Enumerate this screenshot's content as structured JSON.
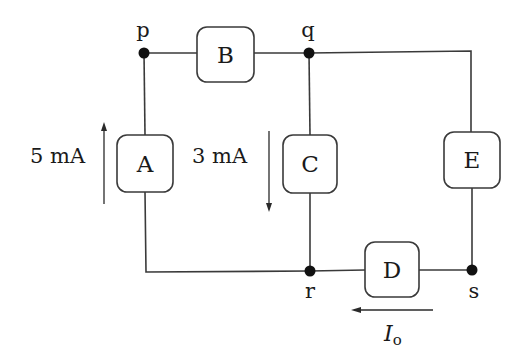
{
  "diagram": {
    "type": "circuit",
    "nodes": [
      {
        "id": "p",
        "label": "p",
        "x": 144,
        "y": 53
      },
      {
        "id": "q",
        "label": "q",
        "x": 309,
        "y": 53
      },
      {
        "id": "r",
        "label": "r",
        "x": 310,
        "y": 271
      },
      {
        "id": "s",
        "label": "s",
        "x": 472,
        "y": 270
      }
    ],
    "elements": [
      {
        "id": "A",
        "label": "A",
        "between": [
          "p",
          "r"
        ]
      },
      {
        "id": "B",
        "label": "B",
        "between": [
          "p",
          "q"
        ]
      },
      {
        "id": "C",
        "label": "C",
        "between": [
          "q",
          "r"
        ]
      },
      {
        "id": "D",
        "label": "D",
        "between": [
          "r",
          "s"
        ]
      },
      {
        "id": "E",
        "label": "E",
        "between": [
          "q",
          "s"
        ]
      }
    ],
    "currents": [
      {
        "id": "iA",
        "label": "5 mA",
        "element": "A",
        "direction": "up"
      },
      {
        "id": "iC",
        "label": "3 mA",
        "element": "C",
        "direction": "down"
      },
      {
        "id": "iD",
        "label_main": "I",
        "label_sub": "o",
        "element": "D",
        "direction": "left"
      }
    ]
  },
  "colors": {
    "wire": "#3a3a3a",
    "node": "#111111",
    "background": "#ffffff"
  }
}
